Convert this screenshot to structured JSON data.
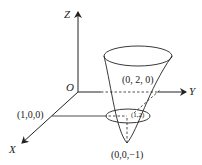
{
  "diagram": {
    "type": "3d-coordinate-paraboloid",
    "axes": {
      "z_label": "Z",
      "y_label": "Y",
      "x_label": "X",
      "origin_label": "O"
    },
    "points": {
      "x_point": "(1,0,0)",
      "y_point": "(0, 2, 0)",
      "vertex": "(0,0,−1)",
      "cross_section": "(1,2)"
    },
    "colors": {
      "stroke": "#222222",
      "background": "#ffffff"
    }
  }
}
